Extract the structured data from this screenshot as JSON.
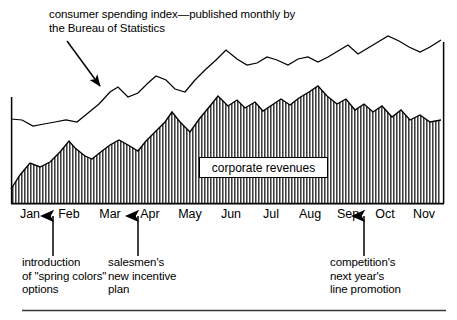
{
  "figure": {
    "annotations": {
      "top_note": "consumer spending index—published monthly by\nthe Bureau of Statistics",
      "intro_note": "introduction\nof \"spring colors\"\noptions",
      "salesmen_note": "salesmen's\nnew incentive\nplan",
      "competition_note": "competition's\nnext year's\nline promotion"
    },
    "series_label": "corporate revenues",
    "colors": {
      "line": "#000000",
      "fill_hatch": "#555555",
      "background": "#ffffff",
      "rule": "#3a3a3a"
    }
  },
  "chart_data": {
    "type": "area",
    "title": "consumer spending index—published monthly by the Bureau of Statistics",
    "subtitle": "",
    "xlabel": "",
    "ylabel": "",
    "grid": false,
    "legend_position": "inline-label",
    "categories": [
      "Jan",
      "Feb",
      "Mar",
      "Apr",
      "May",
      "Jun",
      "Jul",
      "Aug",
      "Sep",
      "Oct",
      "Nov"
    ],
    "tick_positions_px": [
      30,
      69,
      110,
      150,
      190,
      231,
      271,
      310,
      348,
      385,
      424
    ],
    "x_domain_px": [
      11,
      444
    ],
    "baseline_px": 203,
    "series": [
      {
        "name": "consumer spending index",
        "style": "line",
        "points_px": [
          [
            11,
            119
          ],
          [
            22,
            120
          ],
          [
            33,
            126
          ],
          [
            44,
            124
          ],
          [
            55,
            122
          ],
          [
            66,
            120
          ],
          [
            77,
            122
          ],
          [
            88,
            113
          ],
          [
            99,
            104
          ],
          [
            110,
            92
          ],
          [
            118,
            87
          ],
          [
            128,
            97
          ],
          [
            138,
            93
          ],
          [
            148,
            83
          ],
          [
            156,
            76
          ],
          [
            166,
            80
          ],
          [
            175,
            89
          ],
          [
            185,
            92
          ],
          [
            195,
            80
          ],
          [
            205,
            70
          ],
          [
            216,
            60
          ],
          [
            226,
            50
          ],
          [
            237,
            59
          ],
          [
            247,
            65
          ],
          [
            257,
            63
          ],
          [
            267,
            57
          ],
          [
            277,
            60
          ],
          [
            288,
            65
          ],
          [
            298,
            59
          ],
          [
            308,
            57
          ],
          [
            318,
            62
          ],
          [
            328,
            57
          ],
          [
            338,
            51
          ],
          [
            348,
            45
          ],
          [
            358,
            54
          ],
          [
            368,
            48
          ],
          [
            378,
            42
          ],
          [
            388,
            36
          ],
          [
            399,
            41
          ],
          [
            409,
            47
          ],
          [
            420,
            52
          ],
          [
            430,
            47
          ],
          [
            441,
            40
          ]
        ]
      },
      {
        "name": "corporate revenues",
        "style": "area-hatched",
        "points_px": [
          [
            11,
            189
          ],
          [
            20,
            175
          ],
          [
            30,
            163
          ],
          [
            40,
            167
          ],
          [
            50,
            162
          ],
          [
            60,
            152
          ],
          [
            69,
            141
          ],
          [
            75,
            148
          ],
          [
            85,
            156
          ],
          [
            92,
            159
          ],
          [
            102,
            151
          ],
          [
            110,
            145
          ],
          [
            119,
            140
          ],
          [
            128,
            145
          ],
          [
            138,
            151
          ],
          [
            146,
            141
          ],
          [
            155,
            132
          ],
          [
            165,
            122
          ],
          [
            172,
            112
          ],
          [
            180,
            122
          ],
          [
            190,
            132
          ],
          [
            200,
            118
          ],
          [
            210,
            106
          ],
          [
            218,
            96
          ],
          [
            228,
            106
          ],
          [
            237,
            100
          ],
          [
            245,
            108
          ],
          [
            255,
            102
          ],
          [
            263,
            111
          ],
          [
            272,
            105
          ],
          [
            281,
            99
          ],
          [
            290,
            105
          ],
          [
            299,
            98
          ],
          [
            309,
            92
          ],
          [
            318,
            86
          ],
          [
            327,
            96
          ],
          [
            337,
            104
          ],
          [
            346,
            99
          ],
          [
            355,
            110
          ],
          [
            364,
            104
          ],
          [
            373,
            112
          ],
          [
            382,
            106
          ],
          [
            392,
            117
          ],
          [
            401,
            110
          ],
          [
            410,
            120
          ],
          [
            420,
            115
          ],
          [
            430,
            122
          ],
          [
            441,
            120
          ]
        ]
      }
    ],
    "event_markers": [
      {
        "label": "introduction of \"spring colors\" options",
        "x_px": 53,
        "month": "Jan/Feb"
      },
      {
        "label": "salesmen's new incentive plan",
        "x_px": 138,
        "month": "Mar/Apr"
      },
      {
        "label": "competition's next year's line promotion",
        "x_px": 364,
        "month": "Sep/Oct"
      }
    ]
  }
}
